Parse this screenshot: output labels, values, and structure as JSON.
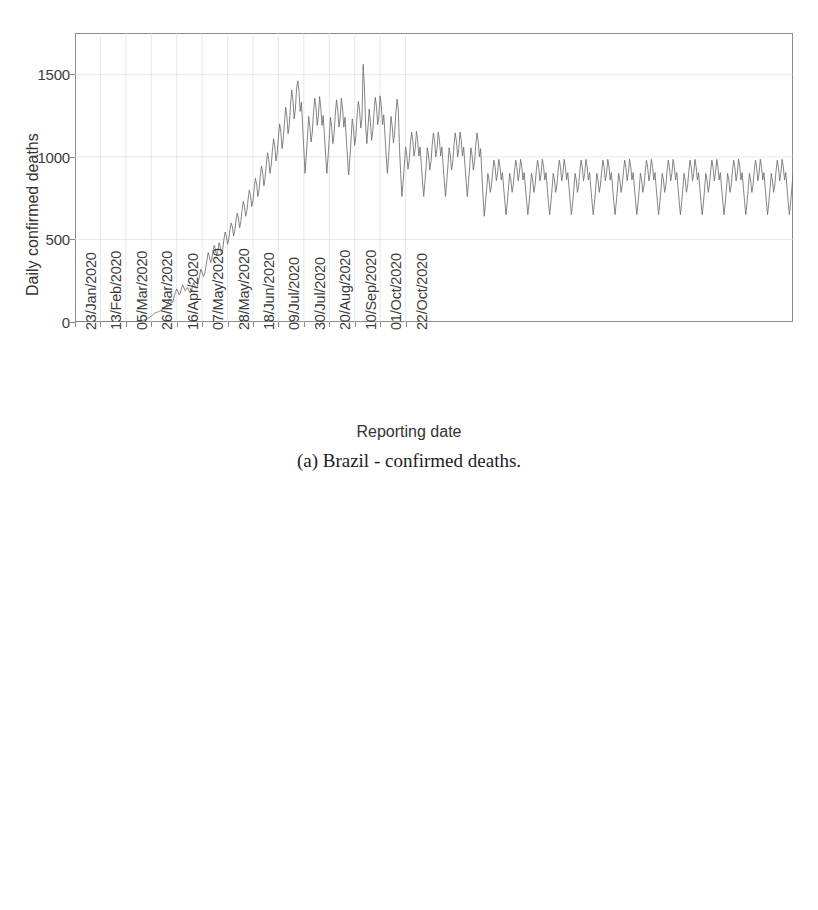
{
  "figure": {
    "kind": "two-panel scanned figure",
    "page_width": 818,
    "page_height": 910
  },
  "panel_a": {
    "caption": "(a) Brazil - confirmed deaths.",
    "xaxis_title": "Reporting date",
    "yaxis_title": "Daily confirmed deaths"
  },
  "panel_b": {
    "caption": "",
    "xaxis_title": "",
    "yaxis_title": "Daily confirmed cases"
  },
  "chart_data": [
    {
      "type": "line",
      "title": "(a) Brazil - confirmed deaths.",
      "xlabel": "Reporting date",
      "ylabel": "Daily confirmed deaths",
      "ylim": [
        0,
        1750
      ],
      "yticks": [
        0,
        500,
        1000,
        1500
      ],
      "ytick_labels": [
        "0",
        "500",
        "1000",
        "1500"
      ],
      "grid": true,
      "legend": "none",
      "xtick_labels": [
        "23/Jan/2020",
        "13/Feb/2020",
        "05/Mar/2020",
        "26/Mar/2020",
        "16/Apr/2020",
        "07/May/2020",
        "28/May/2020",
        "18/Jun/2020",
        "09/Jul/2020",
        "30/Jul/2020",
        "20/Aug/2020",
        "10/Sep/2020",
        "01/Oct/2020",
        "22/Oct/2020"
      ],
      "xtick_index": [
        0,
        21,
        42,
        63,
        84,
        105,
        126,
        147,
        168,
        189,
        210,
        231,
        252,
        273
      ],
      "x_start_label": "23/Jan/2020",
      "n_points": 286,
      "values": [
        0,
        0,
        0,
        0,
        0,
        0,
        0,
        0,
        0,
        0,
        0,
        0,
        0,
        0,
        0,
        0,
        0,
        0,
        0,
        0,
        0,
        0,
        0,
        0,
        0,
        0,
        0,
        0,
        0,
        0,
        0,
        0,
        0,
        0,
        0,
        0,
        0,
        0,
        0,
        0,
        0,
        0,
        0,
        0,
        0,
        0,
        0,
        0,
        0,
        1,
        1,
        2,
        3,
        4,
        6,
        8,
        10,
        13,
        15,
        18,
        22,
        25,
        30,
        36,
        42,
        48,
        55,
        58,
        60,
        62,
        66,
        70,
        75,
        82,
        88,
        95,
        105,
        120,
        140,
        130,
        115,
        125,
        160,
        180,
        200,
        185,
        165,
        175,
        205,
        225,
        206,
        190,
        200,
        210,
        190,
        175,
        185,
        215,
        240,
        220,
        205,
        215,
        250,
        285,
        320,
        300,
        275,
        290,
        330,
        375,
        420,
        395,
        360,
        380,
        430,
        465,
        440,
        400,
        430,
        480,
        455,
        410,
        440,
        500,
        545,
        520,
        470,
        500,
        560,
        600,
        575,
        520,
        555,
        615,
        660,
        630,
        570,
        610,
        680,
        730,
        700,
        640,
        675,
        745,
        800,
        765,
        700,
        735,
        810,
        870,
        835,
        760,
        800,
        880,
        945,
        905,
        825,
        870,
        955,
        1025,
        985,
        900,
        945,
        1035,
        1110,
        1065,
        975,
        1020,
        1120,
        1200,
        1150,
        1050,
        1105,
        1210,
        1300,
        1245,
        1140,
        1195,
        1310,
        1405,
        1345,
        1230,
        1290,
        1415,
        1460,
        1395,
        1275,
        1330,
        1180,
        1045,
        900,
        1005,
        1120,
        1245,
        1185,
        1090,
        1150,
        1270,
        1355,
        1300,
        1190,
        1245,
        1365,
        1300,
        1190,
        1250,
        1130,
        1010,
        900,
        1000,
        1115,
        1240,
        1180,
        1080,
        1140,
        1260,
        1345,
        1290,
        1180,
        1235,
        1355,
        1290,
        1180,
        1240,
        1120,
        1000,
        890,
        990,
        1105,
        1230,
        1170,
        1070,
        1130,
        1250,
        1335,
        1285,
        1175,
        1230,
        1560,
        1430,
        1200,
        1080,
        1180,
        1290,
        1210,
        1100,
        1160,
        1275,
        1360,
        1305,
        1195,
        1250,
        1370,
        1305,
        1195,
        1255,
        1135,
        1010,
        900,
        1000,
        1120,
        1245,
        1185,
        1085,
        1145,
        1265,
        1350,
        1290,
        1050,
        900,
        760,
        850,
        950,
        1060,
        1010,
        925,
        975,
        1075,
        1150,
        1100,
        1005,
        1050,
        1155,
        1100,
        1005,
        1060,
        955,
        855,
        760,
        845,
        945,
        1055,
        1005,
        920,
        970,
        1070,
        1145,
        1095,
        1000,
        1050,
        1150,
        1100,
        1005,
        1060,
        955,
        855,
        760,
        845,
        945,
        1055,
        1005,
        920,
        970,
        1070,
        1145,
        1095,
        1000,
        1050,
        1150,
        1100,
        1005,
        1060,
        955,
        855,
        760,
        845,
        945,
        1055,
        1005,
        920,
        970,
        1070,
        1145,
        1095,
        1000,
        1050,
        900,
        760,
        640,
        720,
        805,
        900,
        860,
        785,
        830,
        915,
        980,
        935,
        855,
        900,
        985,
        940,
        860,
        905,
        815,
        730,
        650,
        720,
        805,
        900,
        860,
        785,
        830,
        915,
        980,
        935,
        855,
        900,
        985,
        940,
        860,
        905,
        815,
        730,
        650,
        720,
        805,
        900,
        860,
        785,
        830,
        915,
        980,
        935,
        855,
        900,
        985,
        940,
        860,
        905,
        815,
        730,
        650,
        720,
        805,
        900,
        860,
        785,
        830,
        915,
        980,
        935,
        855,
        900,
        985,
        940,
        860,
        905,
        815,
        730,
        650,
        720,
        805,
        900,
        860,
        785,
        830,
        915,
        980,
        935,
        855,
        900,
        985,
        940,
        860,
        905,
        815,
        730,
        650,
        720,
        805,
        900,
        860,
        785,
        830,
        915,
        980,
        935,
        855,
        900,
        985,
        940,
        860,
        905,
        815,
        730,
        650,
        720,
        805,
        900,
        860,
        785,
        830,
        915,
        980,
        935,
        855,
        900,
        985,
        940,
        860,
        905,
        815,
        730,
        650,
        720,
        805,
        900,
        860,
        785,
        830,
        915,
        980,
        935,
        855,
        900,
        985,
        940,
        860,
        905,
        815,
        730,
        650,
        720,
        805,
        900,
        860,
        785,
        830,
        915,
        980,
        935,
        855,
        900,
        985,
        940,
        860,
        905,
        815,
        730,
        650,
        720,
        805,
        900,
        860,
        785,
        830,
        915,
        980,
        935,
        855,
        900,
        985,
        940,
        860,
        905,
        815,
        730,
        650,
        720,
        805,
        900,
        860,
        785,
        830,
        915,
        980,
        935,
        855,
        900,
        985,
        940,
        860,
        905,
        815,
        730,
        650,
        720,
        805,
        900,
        860,
        785,
        830,
        915,
        980,
        935,
        855,
        900,
        985,
        940,
        860,
        905,
        815,
        730,
        650,
        720,
        805,
        900,
        860,
        785,
        830,
        915,
        980,
        935,
        855,
        900,
        985,
        940,
        860,
        905,
        815,
        730,
        650,
        720,
        805,
        900,
        860,
        785,
        830,
        915,
        980,
        935,
        855,
        900,
        985,
        940,
        860,
        905,
        815,
        730,
        650,
        720,
        805,
        900
      ]
    },
    {
      "type": "line",
      "title": "",
      "xlabel": "",
      "ylabel": "Daily confirmed cases",
      "ylim": [
        0,
        2000
      ],
      "yticks": [
        0,
        500,
        1000,
        1500,
        2000
      ],
      "ytick_labels": [
        "0",
        "500",
        "1000",
        "1500",
        "2000"
      ],
      "grid": true,
      "legend": "none",
      "xtick_labels": [
        "23/Jan/2020",
        "13/Feb/2020",
        "05/Mar/2020",
        "26/Mar/2020",
        "16/Apr/2020",
        "07/May/2020",
        "28/May/2020",
        "18/Jun/2020",
        "09/Jul/2020",
        "30/Jul/2020",
        "20/Aug/2020",
        "10/Sep/2020",
        "01/Oct/2020",
        "22/Oct/2020"
      ],
      "xtick_index": [
        0,
        21,
        42,
        63,
        84,
        105,
        126,
        147,
        168,
        189,
        210,
        231,
        252,
        273
      ],
      "n_points": 286,
      "values": [
        0,
        0,
        0,
        0,
        0,
        0,
        0,
        0,
        0,
        0,
        0,
        0,
        0,
        0,
        0,
        0,
        0,
        0,
        0,
        0,
        0,
        0,
        0,
        0,
        0,
        0,
        0,
        0,
        0,
        0,
        0,
        0,
        0,
        0,
        0,
        0,
        0,
        0,
        0,
        0,
        0,
        0,
        0,
        0,
        0,
        0,
        0,
        0,
        0,
        0,
        0,
        0,
        0,
        0,
        0,
        0,
        0,
        0,
        0,
        0,
        2,
        4,
        6,
        10,
        14,
        20,
        26,
        33,
        40,
        46,
        52,
        56,
        60,
        62,
        58,
        54,
        50,
        48,
        52,
        56,
        58,
        55,
        50,
        46,
        44,
        48,
        52,
        50,
        45,
        40,
        38,
        36,
        34,
        32,
        30,
        28,
        26,
        25,
        24,
        23,
        22,
        21,
        20,
        20,
        21,
        22,
        23,
        22,
        21,
        20,
        19,
        18,
        18,
        19,
        20,
        21,
        22,
        23,
        24,
        25,
        26,
        27,
        26,
        25,
        24,
        25,
        26,
        28,
        30,
        32,
        35,
        38,
        40,
        38,
        36,
        38,
        42,
        46,
        50,
        54,
        58,
        62,
        66,
        70,
        68,
        66,
        70,
        76,
        82,
        88,
        82,
        76,
        84,
        96,
        108,
        120,
        112,
        104,
        116,
        132,
        148,
        142,
        136,
        150,
        170,
        190,
        182,
        174,
        190,
        215,
        240,
        230,
        220,
        240,
        270,
        300,
        285,
        270,
        295,
        330,
        370,
        355,
        340,
        375,
        420,
        465,
        445,
        425,
        460,
        510,
        560,
        535,
        510,
        545,
        600,
        640,
        610,
        580,
        620,
        250,
        500,
        300,
        450,
        630,
        560,
        480,
        520,
        590,
        640,
        490,
        430,
        470,
        530,
        580,
        540,
        500,
        545,
        610,
        660,
        630,
        570,
        610,
        690,
        760,
        720,
        660,
        700,
        790,
        860,
        820,
        750,
        790,
        890,
        960,
        915,
        840,
        880,
        985,
        1050,
        1000,
        920,
        960,
        1075,
        1160,
        1105,
        1010,
        1055,
        1180,
        1265,
        1205,
        1105,
        1155,
        1290,
        1385,
        1320,
        1210,
        1265,
        0,
        1450,
        1580,
        1190,
        1090,
        1140,
        1270,
        0,
        1870,
        1300,
        1210,
        1265,
        1400,
        0,
        1480,
        1360,
        1250,
        1310,
        1450,
        0,
        1900,
        1620,
        1250,
        1300,
        1430,
        1540,
        1470,
        1350,
        1410,
        0,
        1890,
        1280,
        1170,
        1225,
        1355,
        1460,
        1390,
        1275,
        1335,
        0,
        1480,
        1400,
        1285,
        1345,
        1480,
        1560,
        1490,
        1365,
        1430,
        0,
        1940,
        1420,
        1305,
        1365,
        1500,
        1605,
        1530,
        1405,
        1470,
        0,
        1620,
        1300,
        1190,
        1245,
        1375,
        1475,
        1405,
        1290,
        1350,
        0,
        1780,
        1420,
        1305,
        1365,
        1500,
        1380,
        1265,
        1325,
        1460,
        0,
        1560,
        1285,
        1180,
        1235,
        1360,
        1460,
        1390,
        1275,
        1335,
        1470,
        1400,
        1285,
        1345,
        1480,
        1265,
        1160,
        1215,
        1340,
        1440,
        0,
        1370,
        1260,
        1320,
        1450,
        1390,
        1275,
        1335,
        1470,
        1180,
        1085,
        1135,
        1250,
        1345,
        1280,
        1175,
        1230,
        1355,
        1290,
        1185,
        1240,
        1365,
        1300,
        1190,
        1250,
        1130,
        1040,
        1090,
        1200,
        1290,
        1230,
        1130,
        1180,
        1300,
        1240,
        1140,
        1195,
        1315,
        1250,
        1150,
        1205,
        1090,
        1000,
        1050,
        1155,
        1240,
        1185,
        1085,
        1135,
        1250,
        1195,
        1095,
        1150,
        1265,
        1205,
        1105,
        1160,
        1045,
        960,
        1010,
        1110,
        1195,
        1140,
        1045,
        1095,
        1205,
        1150,
        1055,
        1105,
        1215,
        1160,
        1065,
        1115,
        1005,
        925,
        970,
        1070,
        1150,
        1095,
        1005,
        1055,
        1160,
        1105,
        1015,
        1065,
        1170,
        1115,
        1025,
        1075,
        970,
        890,
        935,
        1030,
        1105,
        1055,
        965,
        1015,
        1115,
        1065,
        975,
        1025,
        1130,
        1075,
        985,
        1035,
        935,
        855,
        900,
        990,
        1065,
        1015,
        930,
        975,
        1075,
        1025,
        940,
        985,
        1085,
        1035,
        950,
        995,
        900,
        825,
        865,
        955,
        1025,
        980,
        895,
        940,
        1035,
        990,
        905,
        950,
        1045,
        995,
        915,
        960,
        865,
        795,
        835,
        920,
        990,
        945,
        865,
        905,
        1000,
        955,
        875,
        915,
        1010,
        960,
        880,
        925,
        835,
        765,
        805,
        885,
        955,
        910,
        835,
        875,
        965,
        920,
        845,
        885,
        975,
        930,
        850,
        895,
        805,
        740,
        775,
        855,
        920,
        880,
        805,
        845,
        930,
        885,
        815,
        855,
        940,
        895,
        820,
        860,
        775,
        710,
        745,
        825,
        885,
        845,
        775,
        810,
        895,
        855,
        785,
        825,
        905,
        865,
        790,
        830,
        750,
        690,
        725,
        795,
        855,
        815,
        750,
        785,
        865,
        825,
        755,
        795
      ]
    }
  ]
}
